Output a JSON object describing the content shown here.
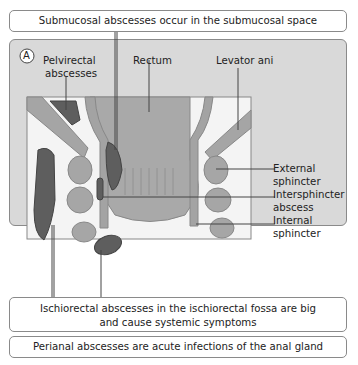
{
  "top_callout": "Submucosal abscesses occur in the submucosal space",
  "panel": {
    "marker": "A",
    "labels": {
      "pelvirectal_1": "Pelvirectal",
      "pelvirectal_2": "abscesses",
      "rectum": "Rectum",
      "levator": "Levator ani",
      "ext_1": "External",
      "ext_2": "sphincter",
      "inter_1": "Intersphincter",
      "inter_2": "abscess",
      "int_1": "Internal",
      "int_2": "sphincter"
    }
  },
  "ischiorectal_callout_1": "Ischiorectal abscesses in the ischiorectal fossa are big",
  "ischiorectal_callout_2": "and cause systemic symptoms",
  "perianal_callout": "Perianal abscesses are acute infections of the anal gland",
  "caption_partial": "Fig..."
}
